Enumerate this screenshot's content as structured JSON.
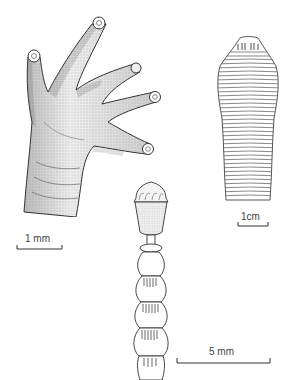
{
  "figures": [
    {
      "id": "hand",
      "description": "Stippled drawing of a hand with four digits ending in round adhesive toe pads",
      "scale_bar": {
        "label": "1 mm"
      }
    },
    {
      "id": "segmented-body",
      "description": "Outline drawing of a flat segmented body with many transverse annuli, tapered at both ends",
      "scale_bar": {
        "label": "1cm"
      }
    },
    {
      "id": "stalked-segments",
      "description": "Drawing of a crowned cup-like head on a stalk followed by bead-like ribbed segments",
      "scale_bar": {
        "label": "5 mm"
      }
    }
  ],
  "colors": {
    "background": "#ffffff",
    "ink": "#333333",
    "stipple": "#555555"
  }
}
